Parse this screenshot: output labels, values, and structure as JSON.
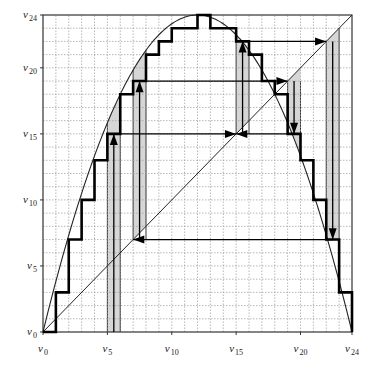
{
  "chart_data": {
    "type": "line",
    "title": "",
    "xlabel": "",
    "ylabel": "",
    "xlim": [
      0,
      24
    ],
    "ylim": [
      0,
      24
    ],
    "grid": true,
    "axis_symbol": "v",
    "x_ticks": [
      {
        "value": 0,
        "symbol": "v",
        "sub": "0"
      },
      {
        "value": 5,
        "symbol": "v",
        "sub": "5"
      },
      {
        "value": 10,
        "symbol": "v",
        "sub": "10"
      },
      {
        "value": 15,
        "symbol": "v",
        "sub": "15"
      },
      {
        "value": 20,
        "symbol": "v",
        "sub": "20"
      },
      {
        "value": 24,
        "symbol": "v",
        "sub": "24"
      }
    ],
    "y_ticks": [
      {
        "value": 0,
        "symbol": "v",
        "sub": "0"
      },
      {
        "value": 5,
        "symbol": "v",
        "sub": "5"
      },
      {
        "value": 10,
        "symbol": "v",
        "sub": "10"
      },
      {
        "value": 15,
        "symbol": "v",
        "sub": "15"
      },
      {
        "value": 20,
        "symbol": "v",
        "sub": "20"
      },
      {
        "value": 24,
        "symbol": "v",
        "sub": "24"
      }
    ],
    "curve": {
      "name": "parabola",
      "formula": "y = x*(24-x)/6",
      "x_range": [
        0,
        24
      ]
    },
    "diagonal": {
      "name": "identity",
      "from": [
        0,
        0
      ],
      "to": [
        24,
        24
      ]
    },
    "step_function": {
      "name": "discretized map",
      "steps": [
        {
          "x0": 0,
          "x1": 1,
          "y": 0
        },
        {
          "x0": 1,
          "x1": 2,
          "y": 3
        },
        {
          "x0": 2,
          "x1": 3,
          "y": 7
        },
        {
          "x0": 3,
          "x1": 4,
          "y": 10
        },
        {
          "x0": 4,
          "x1": 5,
          "y": 13
        },
        {
          "x0": 5,
          "x1": 6,
          "y": 15
        },
        {
          "x0": 6,
          "x1": 7,
          "y": 18
        },
        {
          "x0": 7,
          "x1": 8,
          "y": 19
        },
        {
          "x0": 8,
          "x1": 9,
          "y": 21
        },
        {
          "x0": 9,
          "x1": 10,
          "y": 22
        },
        {
          "x0": 10,
          "x1": 12,
          "y": 23
        },
        {
          "x0": 12,
          "x1": 13,
          "y": 24
        },
        {
          "x0": 13,
          "x1": 15,
          "y": 23
        },
        {
          "x0": 15,
          "x1": 16,
          "y": 22
        },
        {
          "x0": 16,
          "x1": 17,
          "y": 21
        },
        {
          "x0": 17,
          "x1": 18,
          "y": 19
        },
        {
          "x0": 18,
          "x1": 19,
          "y": 18
        },
        {
          "x0": 19,
          "x1": 20,
          "y": 15
        },
        {
          "x0": 20,
          "x1": 21,
          "y": 13
        },
        {
          "x0": 21,
          "x1": 22,
          "y": 10
        },
        {
          "x0": 22,
          "x1": 23,
          "y": 7
        },
        {
          "x0": 23,
          "x1": 24,
          "y": 3
        },
        {
          "x0": 24,
          "x1": 24,
          "y": 0
        }
      ]
    },
    "shaded_strips": [
      {
        "x0": 5,
        "x1": 6,
        "y_bottom": 0,
        "y_top": "curve"
      },
      {
        "x0": 7,
        "x1": 8,
        "y_bottom": 7,
        "y_top": "curve"
      },
      {
        "x0": 15,
        "x1": 16,
        "y_bottom": 15,
        "y_top": "curve"
      },
      {
        "x0": 19,
        "x1": 20,
        "y_bottom": 19,
        "y_top": "curve"
      },
      {
        "x0": 22,
        "x1": 23,
        "y_bottom": 7,
        "y_top": 22
      }
    ],
    "vertical_arrows": [
      {
        "x": 5.5,
        "from": 0,
        "to": 15,
        "direction": "up"
      },
      {
        "x": 7.5,
        "from": 7,
        "to": 19,
        "direction": "up"
      },
      {
        "x": 15.5,
        "from": 15,
        "to": 22,
        "direction": "up"
      },
      {
        "x": 19.5,
        "from": 19,
        "to": 15,
        "direction": "down"
      },
      {
        "x": 22.5,
        "from": 22,
        "to": 7,
        "direction": "down"
      }
    ],
    "horizontal_arrows": [
      {
        "y": 15,
        "from": 5.5,
        "to": 15,
        "direction": "right"
      },
      {
        "y": 15,
        "from": 19.5,
        "to": 15,
        "direction": "left"
      },
      {
        "y": 19,
        "from": 7.5,
        "to": 19,
        "direction": "right"
      },
      {
        "y": 22,
        "from": 15.5,
        "to": 22,
        "direction": "right"
      },
      {
        "y": 7,
        "from": 22.5,
        "to": 7,
        "direction": "left"
      }
    ],
    "colors": {
      "grid": "#9a9a9a",
      "frame": "#333333",
      "step": "#000000",
      "curve": "#222222",
      "shade": "#d6d6d6",
      "arrow": "#000000"
    }
  }
}
